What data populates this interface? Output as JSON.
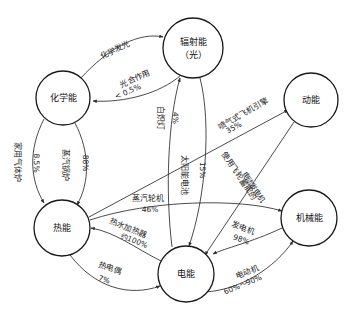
{
  "diagram": {
    "type": "energy-conversion-network",
    "nodes": [
      {
        "id": "chemical",
        "label_line1": "化学能",
        "label_line2": "",
        "cx": 63,
        "cy": 98,
        "r": 27
      },
      {
        "id": "radiant",
        "label_line1": "辐射能",
        "label_line2": "（光）",
        "cx": 193,
        "cy": 48,
        "r": 30
      },
      {
        "id": "kinetic",
        "label_line1": "动能",
        "label_line2": "",
        "cx": 311,
        "cy": 100,
        "r": 27
      },
      {
        "id": "thermal",
        "label_line1": "热能",
        "label_line2": "",
        "cx": 62,
        "cy": 228,
        "r": 28
      },
      {
        "id": "electrical",
        "label_line1": "电能",
        "label_line2": "",
        "cx": 186,
        "cy": 274,
        "r": 28
      },
      {
        "id": "mechanical",
        "label_line1": "机械能",
        "label_line2": "",
        "cx": 309,
        "cy": 218,
        "r": 28
      }
    ],
    "edges": [
      {
        "id": "chem-to-rad",
        "from": "chemical",
        "to": "radiant",
        "name": "化学发光",
        "pct": ""
      },
      {
        "id": "rad-to-chem",
        "from": "radiant",
        "to": "chemical",
        "name": "光合作用",
        "pct": "< 0.5%"
      },
      {
        "id": "chem-to-therm-a",
        "from": "chemical",
        "to": "thermal",
        "name": "家用气体炉",
        "pct": "8.5%"
      },
      {
        "id": "chem-to-therm-b",
        "from": "chemical",
        "to": "thermal",
        "name": "蒸汽锅炉",
        "pct": "88%"
      },
      {
        "id": "elec-to-rad",
        "from": "electrical",
        "to": "radiant",
        "name": "白炽灯",
        "pct": "4%"
      },
      {
        "id": "rad-to-elec",
        "from": "radiant",
        "to": "electrical",
        "name": "太阳能电池",
        "pct": "15%"
      },
      {
        "id": "therm-to-kin",
        "from": "thermal",
        "to": "kinetic",
        "name": "喷气式飞机引擎",
        "pct": "35%"
      },
      {
        "id": "kin-to-elec",
        "from": "kinetic",
        "to": "electrical",
        "name": "使用飞轮蓄能的",
        "pct": "电动发电机"
      },
      {
        "id": "therm-to-mech",
        "from": "thermal",
        "to": "mechanical",
        "name": "蒸汽轮机",
        "pct": "46%"
      },
      {
        "id": "elec-to-therm",
        "from": "electrical",
        "to": "thermal",
        "name": "热水加热器",
        "pct": "约100%"
      },
      {
        "id": "therm-to-elec",
        "from": "thermal",
        "to": "electrical",
        "name": "热电偶",
        "pct": "7%"
      },
      {
        "id": "mech-to-elec",
        "from": "mechanical",
        "to": "electrical",
        "name": "发电机",
        "pct": "98%"
      },
      {
        "id": "elec-to-mech",
        "from": "electrical",
        "to": "mechanical",
        "name": "电动机",
        "pct": "60%～90%"
      }
    ],
    "colors": {
      "stroke": "#2b2b2b",
      "node_stroke": "#1a1a1a",
      "background": "#ffffff",
      "text": "#111111"
    }
  }
}
